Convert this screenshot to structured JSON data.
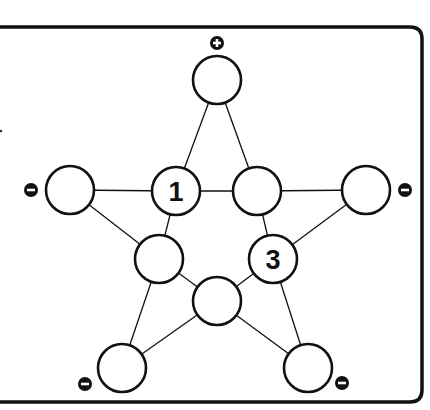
{
  "puzzle": {
    "type": "star-number-puzzle",
    "colors": {
      "line": "#111111",
      "circle_fill": "#ffffff",
      "sign_fill": "#111111",
      "background": "#ffffff"
    },
    "nodes": [
      {
        "id": "top",
        "cx": 217,
        "cy": 80,
        "value": "",
        "sign": "+",
        "sign_x": 217,
        "sign_y": 43
      },
      {
        "id": "left",
        "cx": 70,
        "cy": 190,
        "value": "",
        "sign": "-",
        "sign_x": 31,
        "sign_y": 190
      },
      {
        "id": "inner-left",
        "cx": 176,
        "cy": 191,
        "value": "1",
        "sign": ""
      },
      {
        "id": "inner-right",
        "cx": 257,
        "cy": 191,
        "value": "",
        "sign": ""
      },
      {
        "id": "right",
        "cx": 366,
        "cy": 190,
        "value": "",
        "sign": "-",
        "sign_x": 405,
        "sign_y": 190
      },
      {
        "id": "inner-lower-left",
        "cx": 159,
        "cy": 259,
        "value": "",
        "sign": ""
      },
      {
        "id": "inner-lower-right",
        "cx": 273,
        "cy": 259,
        "value": "3",
        "sign": ""
      },
      {
        "id": "inner-bottom",
        "cx": 217,
        "cy": 301,
        "value": "",
        "sign": ""
      },
      {
        "id": "bottom-left",
        "cx": 122,
        "cy": 368,
        "value": "",
        "sign": "-",
        "sign_x": 85,
        "sign_y": 384
      },
      {
        "id": "bottom-right",
        "cx": 308,
        "cy": 368,
        "value": "",
        "sign": "-",
        "sign_x": 342,
        "sign_y": 383
      }
    ],
    "edges": [
      [
        "top",
        "inner-left"
      ],
      [
        "inner-left",
        "inner-lower-left"
      ],
      [
        "inner-lower-left",
        "bottom-left"
      ],
      [
        "top",
        "inner-right"
      ],
      [
        "inner-right",
        "inner-lower-right"
      ],
      [
        "inner-lower-right",
        "bottom-right"
      ],
      [
        "left",
        "inner-left"
      ],
      [
        "inner-left",
        "inner-right"
      ],
      [
        "inner-right",
        "right"
      ],
      [
        "left",
        "inner-lower-left"
      ],
      [
        "inner-lower-left",
        "inner-bottom"
      ],
      [
        "inner-bottom",
        "bottom-right"
      ],
      [
        "right",
        "inner-lower-right"
      ],
      [
        "inner-lower-right",
        "inner-bottom"
      ],
      [
        "inner-bottom",
        "bottom-left"
      ]
    ],
    "circle_radius": 24,
    "sign_radius": 7,
    "frame": {
      "left": -20,
      "top": 27,
      "right": 422,
      "bottom": 402,
      "corner_radius": 12
    }
  }
}
